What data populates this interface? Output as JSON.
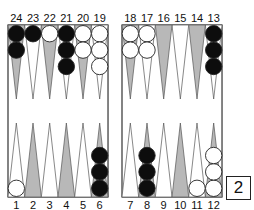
{
  "game": "backgammon",
  "colors": {
    "light_point": "#ffffff",
    "dark_point": "#b8b8b8",
    "black_checker": "#0d0d0d",
    "white_checker": "#ffffff",
    "outline": "#333333"
  },
  "top_labels": [
    "24",
    "23",
    "22",
    "21",
    "20",
    "19",
    "18",
    "17",
    "16",
    "15",
    "14",
    "13"
  ],
  "bottom_labels": [
    "1",
    "2",
    "3",
    "4",
    "5",
    "6",
    "7",
    "8",
    "9",
    "10",
    "11",
    "12"
  ],
  "points": {
    "1": {
      "color": "white",
      "count": 1
    },
    "2": {
      "color": "none",
      "count": 0
    },
    "3": {
      "color": "none",
      "count": 0
    },
    "4": {
      "color": "none",
      "count": 0
    },
    "5": {
      "color": "none",
      "count": 0
    },
    "6": {
      "color": "black",
      "count": 3
    },
    "7": {
      "color": "none",
      "count": 0
    },
    "8": {
      "color": "black",
      "count": 3
    },
    "9": {
      "color": "none",
      "count": 0
    },
    "10": {
      "color": "none",
      "count": 0
    },
    "11": {
      "color": "white",
      "count": 1
    },
    "12": {
      "color": "white",
      "count": 3
    },
    "13": {
      "color": "black",
      "count": 3
    },
    "14": {
      "color": "none",
      "count": 0
    },
    "15": {
      "color": "none",
      "count": 0
    },
    "16": {
      "color": "none",
      "count": 0
    },
    "17": {
      "color": "white",
      "count": 2
    },
    "18": {
      "color": "white",
      "count": 2
    },
    "19": {
      "color": "white",
      "count": 3
    },
    "20": {
      "color": "white",
      "count": 2
    },
    "21": {
      "color": "black",
      "count": 3
    },
    "22": {
      "color": "white",
      "count": 1
    },
    "23": {
      "color": "black",
      "count": 1
    },
    "24": {
      "color": "black",
      "count": 2
    }
  },
  "cube": {
    "value": "2"
  }
}
